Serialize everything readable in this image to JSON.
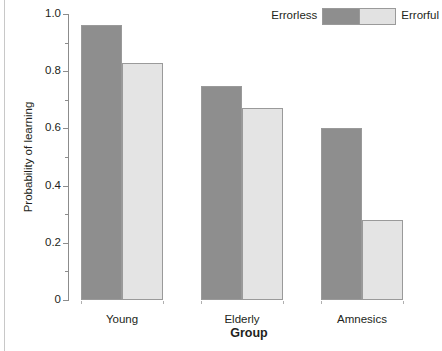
{
  "chart_data": {
    "type": "bar",
    "title": "",
    "xlabel": "Group",
    "ylabel": "Probability of learning",
    "categories": [
      "Young",
      "Elderly",
      "Amnesics"
    ],
    "series": [
      {
        "name": "Errorless",
        "color": "#8e8e8e",
        "values": [
          0.96,
          0.75,
          0.6
        ]
      },
      {
        "name": "Errorful",
        "color": "#e4e4e4",
        "values": [
          0.83,
          0.67,
          0.28
        ]
      }
    ],
    "ylim": [
      0,
      1.0
    ],
    "y_major_ticks": [
      0,
      0.2,
      0.4,
      0.6,
      0.8,
      1.0
    ],
    "y_major_tick_labels": [
      "0",
      "0.2",
      "0.4",
      "0.6",
      "0.8",
      "1.0"
    ],
    "y_minor_ticks": [
      0.1,
      0.3,
      0.5,
      0.7,
      0.9
    ],
    "grid": false,
    "legend_position": "top-right",
    "legend_entries": [
      "Errorless",
      "Errorful"
    ]
  },
  "axes": {
    "y_title": "Probability of learning",
    "x_title": "Group"
  },
  "legend": {
    "left_label": "Errorless",
    "right_label": "Errorful",
    "left_color": "#8e8e8e",
    "right_color": "#e4e4e4"
  }
}
